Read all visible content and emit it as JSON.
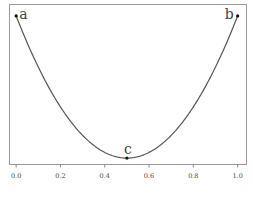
{
  "chart_data": {
    "type": "line",
    "title": "",
    "xlabel": "",
    "ylabel": "",
    "xlim": [
      -0.03,
      1.04
    ],
    "ylim": [
      -0.045,
      1.08
    ],
    "grid": false,
    "x_ticks": [
      0.0,
      0.2,
      0.4,
      0.6,
      0.8,
      1.0
    ],
    "x_tick_labels": [
      "0.0",
      "0.2",
      "0.4",
      "0.6",
      "0.8",
      "1.0"
    ],
    "series": [
      {
        "name": "curve",
        "function": "4*(x-0.5)^2",
        "x_range": [
          0,
          1
        ],
        "color": "#555555"
      }
    ],
    "points": [
      {
        "label": "a",
        "x": 0.0,
        "y": 1.0
      },
      {
        "label": "b",
        "x": 1.0,
        "y": 1.0
      },
      {
        "label": "c",
        "x": 0.5,
        "y": 0.0
      }
    ]
  }
}
